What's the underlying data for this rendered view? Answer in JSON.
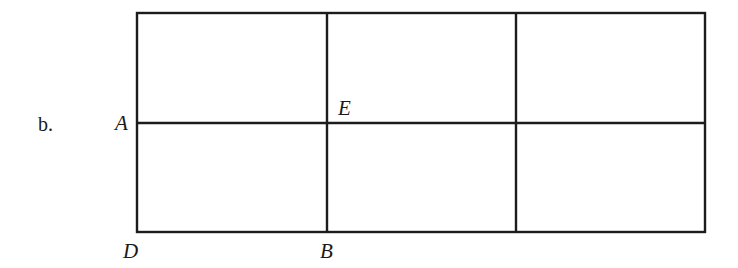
{
  "part_label": "b.",
  "figure": {
    "columns": 3,
    "rows": 2,
    "line_color": "#1c1c1c",
    "points": {
      "A": "A",
      "E": "E",
      "D": "D",
      "B": "B"
    }
  }
}
